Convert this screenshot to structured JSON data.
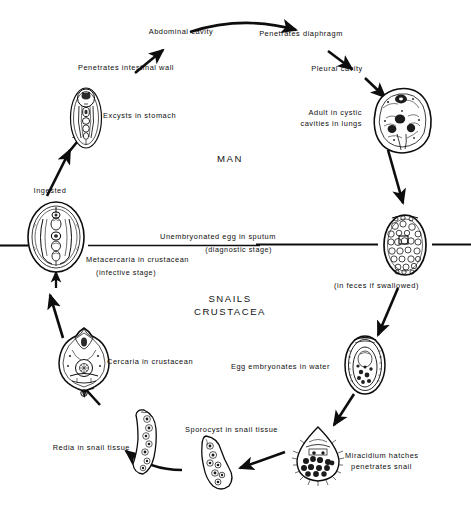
{
  "diagram": {
    "type": "parasite-life-cycle",
    "host_labels": [
      {
        "id": "man",
        "text": "MAN"
      },
      {
        "id": "snails-crustacea",
        "line1": "SNAILS",
        "line2": "CRUSTACEA"
      }
    ],
    "stages": [
      {
        "id": "abdominal-cavity",
        "text": "Abdominal cavity"
      },
      {
        "id": "penetrates-diaphragm",
        "text": "Penetrates diaphragm"
      },
      {
        "id": "penetrates-intestinal-wall",
        "text": "Penetrates intestinal wall"
      },
      {
        "id": "pleural-cavity",
        "text": "Pleural cavity"
      },
      {
        "id": "excysts-in-stomach",
        "text": "Excysts in stomach"
      },
      {
        "id": "adult-in-cystic-cavities",
        "line1": "Adult in cystic",
        "line2": "cavities in lungs"
      },
      {
        "id": "ingested",
        "text": "Ingested"
      },
      {
        "id": "unembryonated-egg",
        "line1": "Unembryonated egg in sputum",
        "line2": "(diagnostic stage)"
      },
      {
        "id": "in-feces-if-swallowed",
        "text": "(in feces if swallowed)"
      },
      {
        "id": "metacercaria",
        "line1": "Metacercaria in crustacean",
        "line2": "(infective stage)"
      },
      {
        "id": "egg-embryonates",
        "text": "Egg embryonates in water"
      },
      {
        "id": "cercaria",
        "text": "Cercaria in crustacean"
      },
      {
        "id": "miracidium",
        "line1": "Miracidium hatches",
        "line2": "penetrates snail"
      },
      {
        "id": "sporocyst",
        "text": "Sporocyst in snail tissue"
      },
      {
        "id": "redia",
        "text": "Redia in snail tissue"
      }
    ],
    "colors": {
      "ink": "#0d0d0d",
      "background": "#ffffff"
    }
  }
}
